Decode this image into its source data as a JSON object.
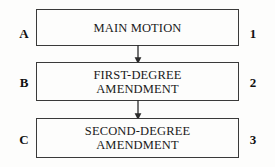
{
  "diagram": {
    "background_color": "#fdfdfc",
    "border_color": "#3a3a3a",
    "text_color": "#1a1a1a",
    "nodes": [
      {
        "id": "node-1",
        "label": "MAIN MOTION",
        "left_tag": "A",
        "right_tag": "1"
      },
      {
        "id": "node-2",
        "label": "FIRST-DEGREE\nAMENDMENT",
        "left_tag": "B",
        "right_tag": "2"
      },
      {
        "id": "node-3",
        "label": "SECOND-DEGREE\nAMENDMENT",
        "left_tag": "C",
        "right_tag": "3"
      }
    ],
    "connectors": [
      {
        "id": "connector-1",
        "from": "node-1",
        "to": "node-2",
        "style": "arrow-down"
      },
      {
        "id": "connector-2",
        "from": "node-2",
        "to": "node-3",
        "style": "arrow-down"
      }
    ]
  }
}
